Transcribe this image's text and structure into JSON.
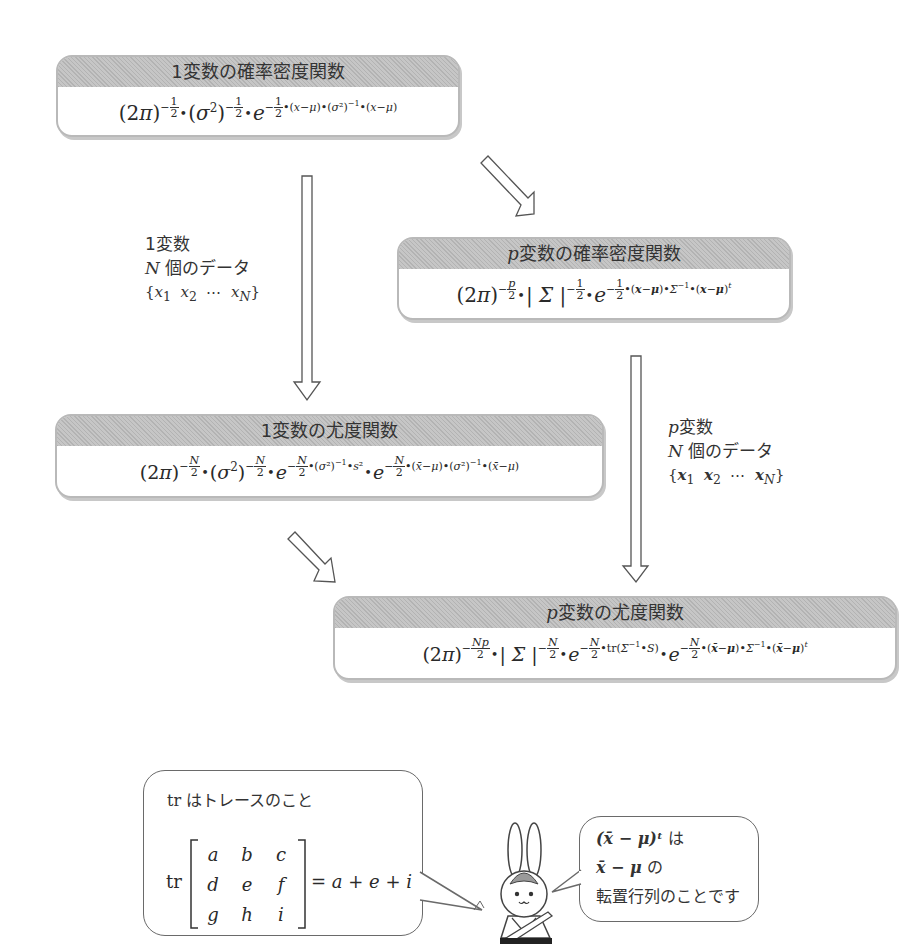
{
  "boxes": {
    "uni_pdf": {
      "title": "1変数の確率密度関数",
      "formula": "(2π)^(-1/2)・(σ²)^(-1/2)・e^(-1/2・(x-μ)・(σ²)^-1・(x-μ))"
    },
    "multi_pdf": {
      "title_var": "p",
      "title": "変数の確率密度関数",
      "formula": "(2π)^(-p/2)・|Σ|^(-1/2)・e^(-1/2・(x-μ)・Σ^-1・(x-μ)^t)"
    },
    "uni_lik": {
      "title": "1変数の尤度関数",
      "formula": "(2π)^(-N/2)・(σ²)^(-N/2)・e^(-N/2・(σ²)^-1・s²)・e^(-N/2・(x̄-μ)・(σ²)^-1・(x̄-μ))"
    },
    "multi_lik": {
      "title_var": "p",
      "title": "変数の尤度関数",
      "formula": "(2π)^(-Np/2)・|Σ|^(-N/2)・e^(-N/2・tr(Σ^-1・S))・e^(-N/2・(x̄-μ)・Σ^-1・(x̄-μ)^t)"
    }
  },
  "notes": {
    "uni_data": {
      "line1": "1変数",
      "line2_var": "N",
      "line2": "個のデータ",
      "line3": "{x₁ x₂ ⋯ x_N}"
    },
    "multi_data": {
      "line1_var": "p",
      "line1": "変数",
      "line2_var": "N",
      "line2": "個のデータ",
      "line3": "{𝒙₁ 𝒙₂ ⋯ 𝒙_N}"
    }
  },
  "bubbles": {
    "trace": {
      "title_tr": "tr",
      "title": "はトレースのこと",
      "op": "tr",
      "matrix": [
        [
          "a",
          "b",
          "c"
        ],
        [
          "d",
          "e",
          "f"
        ],
        [
          "g",
          "h",
          "i"
        ]
      ],
      "result": "= a + e + i"
    },
    "transpose": {
      "line1_math": "(x̄ − μ)ᵗ",
      "line1": "は",
      "line2_math": "x̄ − μ",
      "line2": "の",
      "line3": "転置行列のことです"
    }
  },
  "character": {
    "name": "rabbit-mascot"
  }
}
